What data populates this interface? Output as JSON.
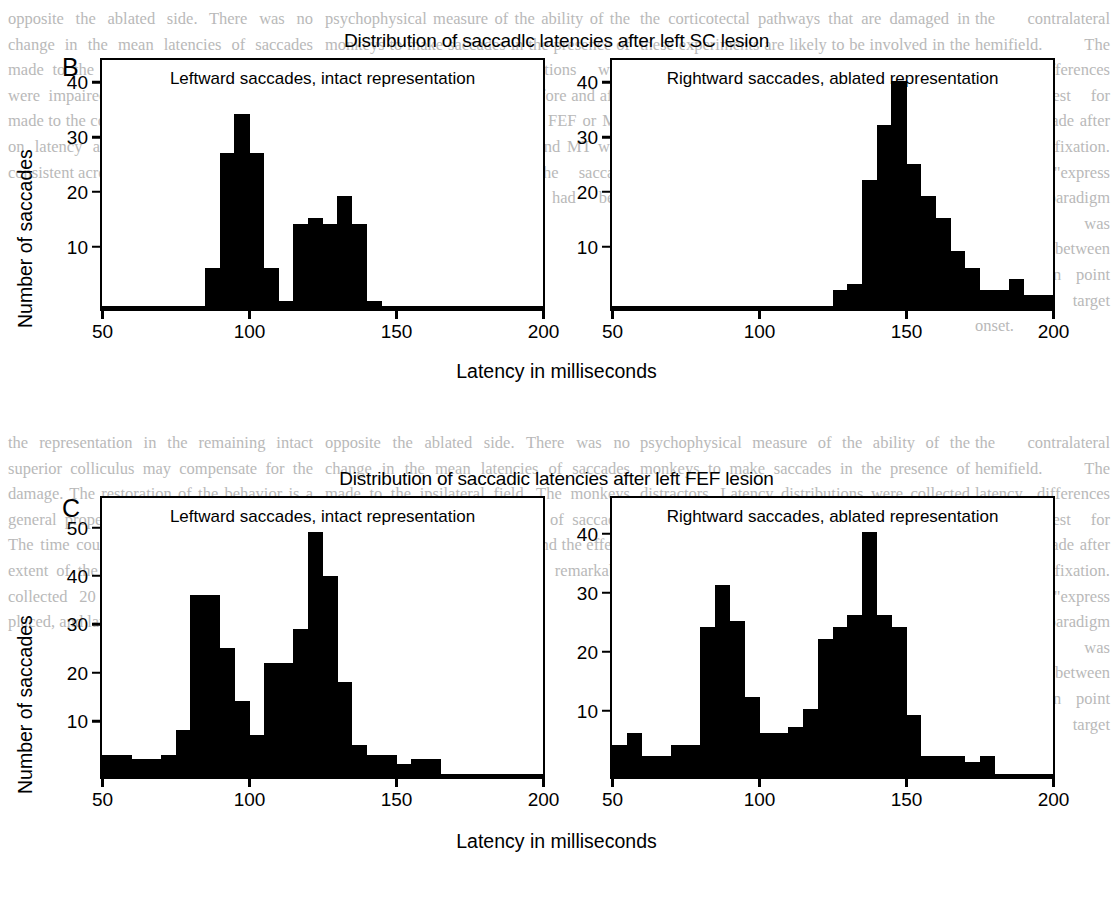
{
  "figure": {
    "ylabel": "Number of saccades",
    "xlabel": "Latency in milliseconds"
  },
  "panels": [
    {
      "letter": "B",
      "title": "Distribution of saccadlc latencies after left SC lesion",
      "plots": [
        {
          "subtitle": "Leftward saccades, intact representation",
          "yticks": [
            "10",
            "20",
            "30",
            "40"
          ],
          "xticks": [
            "50",
            "100",
            "150",
            "200"
          ]
        },
        {
          "subtitle": "Rightward saccades, ablated representation",
          "yticks": [
            "10",
            "20",
            "30",
            "40"
          ],
          "xticks": [
            "50",
            "100",
            "150",
            "200"
          ]
        }
      ]
    },
    {
      "letter": "C",
      "title": "Distribution of saccadic latencies after left FEF lesion",
      "plots": [
        {
          "subtitle": "Leftward saccades, intact representation",
          "yticks": [
            "10",
            "20",
            "30",
            "40",
            "50"
          ],
          "xticks": [
            "50",
            "100",
            "150",
            "200"
          ]
        },
        {
          "subtitle": "Rightward saccades, ablated representation",
          "yticks": [
            "10",
            "20",
            "30",
            "40"
          ],
          "xticks": [
            "50",
            "100",
            "150",
            "200"
          ]
        }
      ]
    }
  ],
  "chart_data": [
    {
      "type": "bar",
      "id": "B-left",
      "title": "Leftward saccades, intact representation",
      "panel": "B",
      "xlabel": "Latency in milliseconds",
      "ylabel": "Number of saccades",
      "xlim": [
        50,
        200
      ],
      "ylim": [
        0,
        44
      ],
      "yticks": [
        10,
        20,
        30,
        40
      ],
      "xticks": [
        50,
        100,
        150,
        200
      ],
      "grid": false,
      "bin_width": 5,
      "bin_starts": [
        85,
        90,
        95,
        100,
        105,
        110,
        115,
        120,
        125,
        130,
        135,
        140
      ],
      "values": [
        7,
        28,
        35,
        28,
        7,
        1,
        15,
        16,
        15,
        20,
        15,
        1
      ]
    },
    {
      "type": "bar",
      "id": "B-right",
      "title": "Rightward saccades, ablated representation",
      "panel": "B",
      "xlabel": "Latency in milliseconds",
      "ylabel": "Number of saccades",
      "xlim": [
        50,
        200
      ],
      "ylim": [
        0,
        44
      ],
      "yticks": [
        10,
        20,
        30,
        40
      ],
      "xticks": [
        50,
        100,
        150,
        200
      ],
      "grid": false,
      "bin_width": 5,
      "bin_starts": [
        125,
        130,
        135,
        140,
        145,
        150,
        155,
        160,
        165,
        170,
        175,
        180,
        185,
        190,
        195
      ],
      "values": [
        3,
        4,
        23,
        33,
        41,
        26,
        20,
        16,
        10,
        7,
        3,
        3,
        5,
        2,
        2
      ]
    },
    {
      "type": "bar",
      "id": "C-left",
      "title": "Leftward saccades, intact representation",
      "panel": "C",
      "xlabel": "Latency in milliseconds",
      "ylabel": "Number of saccades",
      "xlim": [
        50,
        200
      ],
      "ylim": [
        0,
        56
      ],
      "yticks": [
        10,
        20,
        30,
        40,
        50
      ],
      "xticks": [
        50,
        100,
        150,
        200
      ],
      "grid": false,
      "bin_width": 5,
      "bin_starts": [
        50,
        55,
        60,
        65,
        70,
        75,
        80,
        85,
        90,
        95,
        100,
        105,
        110,
        115,
        120,
        125,
        130,
        135,
        140,
        145,
        150,
        155,
        160
      ],
      "values": [
        4,
        4,
        3,
        3,
        4,
        9,
        37,
        37,
        26,
        15,
        8,
        23,
        23,
        30,
        50,
        41,
        19,
        6,
        4,
        4,
        2,
        3,
        3
      ]
    },
    {
      "type": "bar",
      "id": "C-right",
      "title": "Rightward saccades, ablated representation",
      "panel": "C",
      "xlabel": "Latency in milliseconds",
      "ylabel": "Number of saccades",
      "xlim": [
        50,
        200
      ],
      "ylim": [
        0,
        46
      ],
      "yticks": [
        10,
        20,
        30,
        40
      ],
      "xticks": [
        50,
        100,
        150,
        200
      ],
      "grid": false,
      "bin_width": 5,
      "bin_starts": [
        45,
        50,
        55,
        60,
        65,
        70,
        75,
        80,
        85,
        90,
        95,
        100,
        105,
        110,
        115,
        120,
        125,
        130,
        135,
        140,
        145,
        150,
        155,
        160,
        165,
        170,
        175
      ],
      "values": [
        5,
        5,
        7,
        3,
        3,
        5,
        5,
        25,
        32,
        26,
        13,
        7,
        7,
        8,
        11,
        23,
        25,
        27,
        41,
        27,
        25,
        10,
        3,
        3,
        3,
        2,
        3
      ]
    }
  ],
  "background_text": {
    "col1": "opposite the ablated side. There was no change in the mean latencies of saccades made to the ipsilateral field. The monkeys were impaired in the accuracy of saccades made to the contralateral field, and the effects on latency and accuracy were remarkably consistent across animals.",
    "col2": "psychophysical measure of the ability of the monkeys to make saccades in the presence of distractors. Latency distributions were collected in the same manner before and after the lesions were made in SC or FEF or MT. Saccades after lesions of FEF and MT were clearly altered, so that the saccade frequencies and latencies had been established as the new baseline.",
    "col3": "the corticotectal pathways that are damaged in these experiments are likely to be involved in the latency effects we describe. Lesions of area MT in the monkey produce a mild deficit in visually guided saccades (Newsome et al. 1985). In these experiments we studied the behavior of monkeys making visually guided saccades. No attempt is made to distinguish the effects of lesions of cortex.",
    "col4": "the contralateral hemifield. The latency differences were largest for saccades made after a period of fixation. In the new \"express saccade\" paradigm a gap was introduced between the fixation point offset and target onset.",
    "col5": "the representation in the remaining intact superior colliculus may compensate for the damage. The restoration of the behavior is a general property of the oculomotor system. The time course of recovery varies with the extent of the lesion. The present data were collected 20 days after the lesions were placed, and latency differences."
  }
}
